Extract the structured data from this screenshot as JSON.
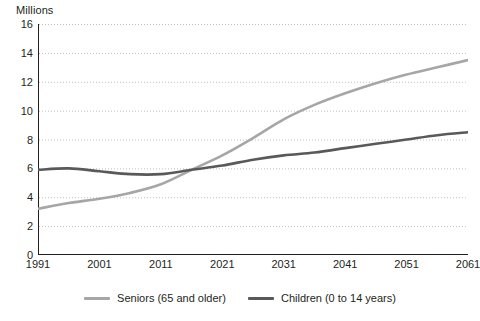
{
  "chart_data": {
    "type": "line",
    "title": "",
    "subtitle": "",
    "ylabel": "Millions",
    "xlabel": "",
    "ylim": [
      0,
      16
    ],
    "xlim": [
      1991,
      2061
    ],
    "y_ticks": [
      0,
      2,
      4,
      6,
      8,
      10,
      12,
      14,
      16
    ],
    "x_ticks": [
      1991,
      2001,
      2011,
      2021,
      2031,
      2041,
      2051,
      2061
    ],
    "grid": "horizontal-dotted",
    "legend_position": "bottom-center",
    "colors": {
      "seniors": "#a6a6a6",
      "children": "#595959",
      "axis": "#231f20",
      "grid": "#bfbfbf"
    },
    "series": [
      {
        "name": "Seniors (65 and older)",
        "color": "#a6a6a6",
        "x": [
          1991,
          1996,
          2001,
          2006,
          2011,
          2016,
          2021,
          2026,
          2031,
          2036,
          2041,
          2046,
          2051,
          2056,
          2061
        ],
        "values": [
          3.2,
          3.6,
          3.9,
          4.3,
          4.9,
          5.9,
          6.9,
          8.1,
          9.4,
          10.4,
          11.2,
          11.9,
          12.5,
          13.0,
          13.5
        ]
      },
      {
        "name": "Children (0 to 14 years)",
        "color": "#595959",
        "x": [
          1991,
          1996,
          2001,
          2006,
          2011,
          2016,
          2021,
          2026,
          2031,
          2036,
          2041,
          2046,
          2051,
          2056,
          2061
        ],
        "values": [
          5.9,
          6.0,
          5.8,
          5.6,
          5.6,
          5.9,
          6.2,
          6.6,
          6.9,
          7.1,
          7.4,
          7.7,
          8.0,
          8.3,
          8.5
        ]
      }
    ]
  },
  "y_axis": {
    "title": "Millions",
    "labels": [
      "16",
      "14",
      "12",
      "10",
      "8",
      "6",
      "4",
      "2",
      "0"
    ]
  },
  "x_axis": {
    "labels": [
      "1991",
      "2001",
      "2011",
      "2021",
      "2031",
      "2041",
      "2051",
      "2061"
    ]
  },
  "legend": {
    "items": [
      {
        "label": "Seniors (65 and older)",
        "color": "#a6a6a6"
      },
      {
        "label": "Children (0 to 14 years)",
        "color": "#595959"
      }
    ]
  }
}
